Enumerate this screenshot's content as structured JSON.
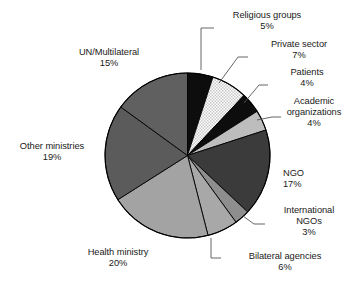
{
  "chart_data": {
    "type": "pie",
    "title": "",
    "subtitle": "",
    "xlabel": "",
    "ylabel": "",
    "legend_position": "none",
    "grid": false,
    "units": "percent",
    "total": 100,
    "start_angle_deg": 0,
    "direction": "clockwise",
    "categories": [
      "Religious groups",
      "Private sector",
      "Patients",
      "Academic organizations",
      "NGO",
      "International NGOs",
      "Bilateral agencies",
      "Health ministry",
      "Other ministries",
      "UN/Multilateral"
    ],
    "values": [
      5,
      7,
      4,
      4,
      17,
      3,
      6,
      20,
      19,
      15
    ],
    "slices": [
      {
        "label": "Religious groups",
        "value": 5,
        "percent_text": "5%",
        "fill": "#0d0d0d",
        "pattern": "solid"
      },
      {
        "label": "Private sector",
        "value": 7,
        "percent_text": "7%",
        "fill": "#e4e4e4",
        "pattern": "dotted"
      },
      {
        "label": "Patients",
        "value": 4,
        "percent_text": "4%",
        "fill": "#0d0d0d",
        "pattern": "solid"
      },
      {
        "label": "Academic organizations",
        "value": 4,
        "percent_text": "4%",
        "fill": "#bdbdbd",
        "pattern": "solid"
      },
      {
        "label": "NGO",
        "value": 17,
        "percent_text": "17%",
        "fill": "#3b3b3b",
        "pattern": "solid"
      },
      {
        "label": "International NGOs",
        "value": 3,
        "percent_text": "3%",
        "fill": "#8e8e8e",
        "pattern": "solid"
      },
      {
        "label": "Bilateral agencies",
        "value": 6,
        "percent_text": "6%",
        "fill": "#a8a8a8",
        "pattern": "solid"
      },
      {
        "label": "Health ministry",
        "value": 20,
        "percent_text": "20%",
        "fill": "#a3a3a3",
        "pattern": "solid"
      },
      {
        "label": "Other ministries",
        "value": 19,
        "percent_text": "19%",
        "fill": "#5b5b5b",
        "pattern": "solid"
      },
      {
        "label": "UN/Multilateral",
        "value": 15,
        "percent_text": "15%",
        "fill": "#606060",
        "pattern": "solid"
      }
    ]
  },
  "labels": {
    "religious_groups": {
      "name": "Religious groups",
      "pct": "5%"
    },
    "private_sector": {
      "name": "Private sector",
      "pct": "7%"
    },
    "patients": {
      "name": "Patients",
      "pct": "4%"
    },
    "academic_line1": {
      "name": "Academic"
    },
    "academic_line2": {
      "name": "organizations",
      "pct": "4%"
    },
    "ngo": {
      "name": "NGO",
      "pct": "17%"
    },
    "international_line1": {
      "name": "International"
    },
    "international_line2": {
      "name": "NGOs",
      "pct": "3%"
    },
    "bilateral_agencies": {
      "name": "Bilateral agencies",
      "pct": "6%"
    },
    "health_ministry": {
      "name": "Health ministry",
      "pct": "20%"
    },
    "other_ministries": {
      "name": "Other ministries",
      "pct": "19%"
    },
    "un_multilateral": {
      "name": "UN/Multilateral",
      "pct": "15%"
    }
  },
  "colors": {
    "background": "#ffffff",
    "text": "#1a1a1a",
    "outline": "#000000",
    "leader_line": "#555555"
  }
}
